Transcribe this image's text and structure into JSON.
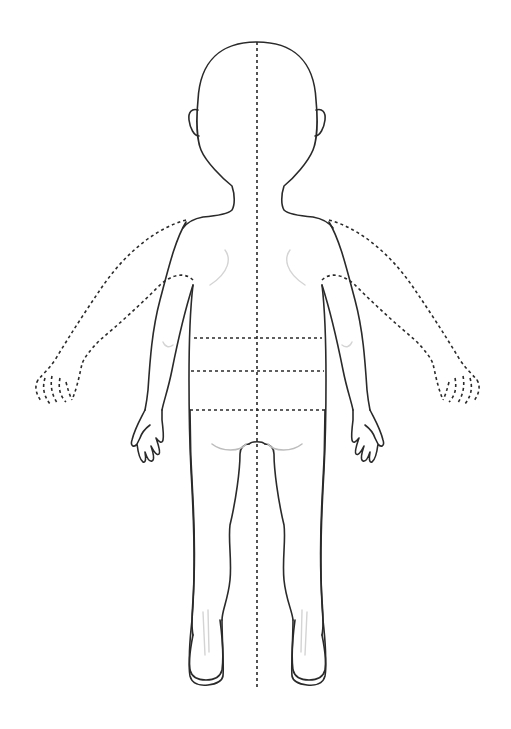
{
  "diagram": {
    "view": "back",
    "figure": "child",
    "colors": {
      "outline": "#2a2a2a",
      "shading": "#bdbdbd",
      "background": "#ffffff"
    },
    "reference_lines": {
      "vertical": [
        {
          "name": "midline",
          "style": "dashed"
        }
      ],
      "horizontal": [
        {
          "name": "upper-back-line",
          "style": "dashed"
        },
        {
          "name": "mid-back-line",
          "style": "dashed"
        },
        {
          "name": "lower-back-line",
          "style": "dashed"
        }
      ]
    },
    "parts": [
      "head",
      "left-ear",
      "right-ear",
      "neck-shoulders",
      "torso",
      "left-arm-lowered",
      "right-arm-lowered",
      "left-arm-raised-dashed",
      "right-arm-raised-dashed",
      "left-hand",
      "right-hand",
      "left-leg",
      "right-leg",
      "buttocks"
    ]
  }
}
